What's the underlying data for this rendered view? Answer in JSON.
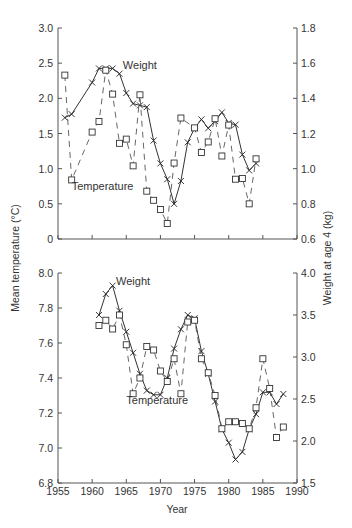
{
  "chart_data": [
    {
      "type": "line",
      "panel": "top",
      "title": "",
      "xlabel": "",
      "ylabel": "Mean temperature (°C)",
      "y2label": "Weight at age 4 (kg)",
      "xlim": [
        1955,
        1990
      ],
      "ylim": [
        0,
        3.0
      ],
      "y2lim": [
        0.6,
        1.8
      ],
      "xticks": [
        1955,
        1960,
        1965,
        1970,
        1975,
        1980,
        1985,
        1990
      ],
      "xtick_labels_shown": false,
      "yticks": [
        0,
        0.5,
        1.0,
        1.5,
        2.0,
        2.5,
        3.0
      ],
      "ytick_labels": [
        "0",
        "0.5",
        "1.0",
        "1.5",
        "2.0",
        "2.5",
        "3.0"
      ],
      "y2ticks": [
        0.6,
        0.8,
        1.0,
        1.2,
        1.4,
        1.6,
        1.8
      ],
      "y2tick_labels": [
        "0.6",
        "0.8",
        "1.0",
        "1.2",
        "1.4",
        "1.6",
        "1.8"
      ],
      "grid": false,
      "annotations": [
        {
          "text": "Weight",
          "near_series": "Weight",
          "x": 1964.5,
          "y": 2.42
        },
        {
          "text": "Temperature",
          "near_series": "Temperature",
          "x": 1957,
          "y": 0.7
        }
      ],
      "series": [
        {
          "name": "Weight",
          "axis": "right",
          "style": "solid",
          "marker": "x",
          "x": [
            1956,
            1957,
            1960,
            1961,
            1962,
            1963,
            1964,
            1965,
            1966,
            1967,
            1968,
            1969,
            1970,
            1971,
            1972,
            1973,
            1974,
            1975,
            1976,
            1977,
            1978,
            1979,
            1980,
            1981,
            1982,
            1983,
            1984
          ],
          "y": [
            1.29,
            1.31,
            1.49,
            1.57,
            1.57,
            1.57,
            1.54,
            1.43,
            1.37,
            1.36,
            1.35,
            1.16,
            1.03,
            0.94,
            0.8,
            0.93,
            1.15,
            1.23,
            1.28,
            1.23,
            1.27,
            1.32,
            1.26,
            1.25,
            1.08,
            0.99,
            1.03
          ]
        },
        {
          "name": "Temperature",
          "axis": "left",
          "style": "dashed",
          "marker": "square",
          "x": [
            1956,
            1957,
            1960,
            1961,
            1962,
            1963,
            1964,
            1965,
            1966,
            1967,
            1968,
            1969,
            1970,
            1971,
            1972,
            1973,
            1975,
            1976,
            1977,
            1978,
            1979,
            1980,
            1981,
            1982,
            1983,
            1984
          ],
          "y": [
            2.33,
            0.84,
            1.52,
            1.67,
            2.4,
            2.06,
            1.36,
            1.42,
            1.04,
            2.05,
            0.68,
            0.55,
            0.42,
            0.22,
            1.08,
            1.72,
            1.58,
            1.23,
            1.38,
            1.71,
            1.18,
            1.62,
            0.85,
            0.86,
            0.5,
            1.14
          ]
        }
      ]
    },
    {
      "type": "line",
      "panel": "bottom",
      "title": "",
      "xlabel": "Year",
      "ylabel": "Mean temperature (°C)",
      "y2label": "Weight at age 4 (kg)",
      "xlim": [
        1955,
        1990
      ],
      "ylim": [
        6.8,
        8.0
      ],
      "y2lim": [
        1.5,
        4.0
      ],
      "xticks": [
        1955,
        1960,
        1965,
        1970,
        1975,
        1980,
        1985,
        1990
      ],
      "xtick_labels": [
        "1955",
        "1960",
        "1965",
        "1970",
        "1975",
        "1980",
        "1985",
        "1990"
      ],
      "yticks": [
        6.8,
        7.0,
        7.2,
        7.4,
        7.6,
        7.8,
        8.0
      ],
      "ytick_labels": [
        "6.8",
        "7.0",
        "7.2",
        "7.4",
        "7.6",
        "7.8",
        "8.0"
      ],
      "y2ticks": [
        1.5,
        2.0,
        2.5,
        3.0,
        3.5,
        4.0
      ],
      "y2tick_labels": [
        "1.5",
        "2.0",
        "2.5",
        "3.0",
        "3.5",
        "4.0"
      ],
      "grid": false,
      "annotations": [
        {
          "text": "Weight",
          "near_series": "Weight",
          "x": 1963.5,
          "y": 7.93
        },
        {
          "text": "Temperature",
          "near_series": "Temperature",
          "x": 1965,
          "y": 7.25
        }
      ],
      "series": [
        {
          "name": "Weight",
          "axis": "right",
          "style": "solid",
          "marker": "x",
          "x": [
            1961,
            1962,
            1963,
            1964,
            1965,
            1966,
            1967,
            1968,
            1969,
            1970,
            1971,
            1972,
            1973,
            1974,
            1975,
            1976,
            1977,
            1978,
            1979,
            1980,
            1981,
            1982,
            1983,
            1984,
            1985,
            1986,
            1987,
            1988
          ],
          "y": [
            3.5,
            3.75,
            3.85,
            3.55,
            3.3,
            3.05,
            2.8,
            2.6,
            2.55,
            2.55,
            2.75,
            3.1,
            3.33,
            3.5,
            3.46,
            3.07,
            2.8,
            2.47,
            2.14,
            1.98,
            1.78,
            1.87,
            2.14,
            2.32,
            2.58,
            2.58,
            2.44,
            2.56
          ]
        },
        {
          "name": "Temperature",
          "axis": "left",
          "style": "dashed",
          "marker": "square",
          "x": [
            1961,
            1962,
            1963,
            1964,
            1965,
            1966,
            1967,
            1968,
            1969,
            1970,
            1971,
            1972,
            1973,
            1974,
            1975,
            1976,
            1977,
            1978,
            1979,
            1980,
            1981,
            1982,
            1983,
            1984,
            1985,
            1986,
            1987,
            1988
          ],
          "y": [
            7.7,
            7.73,
            7.68,
            7.76,
            7.59,
            7.31,
            7.4,
            7.58,
            7.56,
            7.44,
            7.38,
            7.51,
            7.31,
            7.72,
            7.73,
            7.51,
            7.43,
            7.3,
            7.11,
            7.15,
            7.15,
            7.14,
            7.11,
            7.23,
            7.51,
            7.34,
            7.06,
            7.12
          ]
        }
      ]
    }
  ]
}
